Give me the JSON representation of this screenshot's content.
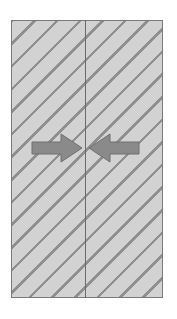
{
  "diagram": {
    "title": "",
    "panels": [
      {
        "id": "left-panel",
        "fill": "#d2d2d2",
        "hatch": "#8f8f8f"
      },
      {
        "id": "right-panel",
        "fill": "#d2d2d2",
        "hatch": "#8f8f8f"
      }
    ],
    "arrows": [
      {
        "id": "left-arrow",
        "direction": "right",
        "color": "#8a8a8a"
      },
      {
        "id": "right-arrow",
        "direction": "left",
        "color": "#8a8a8a"
      }
    ],
    "colors": {
      "border": "#7a7a7a",
      "divider": "#6a6a6a",
      "arrow_fill": "#8a8a8a",
      "arrow_stroke": "#6e6e6e"
    }
  }
}
